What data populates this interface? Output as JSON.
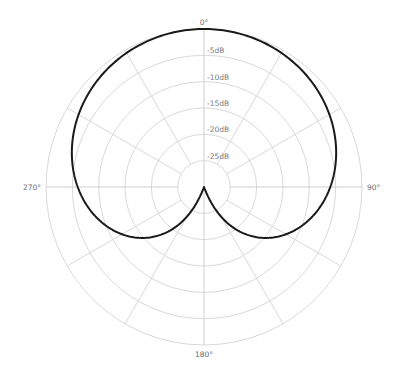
{
  "chart_data": {
    "type": "polar-line",
    "title": "",
    "pattern": "cardioid",
    "center": [
      204,
      187
    ],
    "outer_radius": 158,
    "db_range": [
      -30,
      0
    ],
    "rings_db": [
      0,
      -5,
      -10,
      -15,
      -20,
      -25
    ],
    "ring_labels": [
      "-5dB",
      "-10dB",
      "-15dB",
      "-20dB",
      "-25dB"
    ],
    "spoke_step_deg": 30,
    "angle_labels": [
      {
        "angle": 0,
        "text": "0°"
      },
      {
        "angle": 90,
        "text": "90°"
      },
      {
        "angle": 180,
        "text": "180°"
      },
      {
        "angle": 270,
        "text": "270°"
      }
    ],
    "series": [
      {
        "name": "Cardioid response",
        "formula": "gain = 0.5*(1+cos(theta)), level_dB = 20*log10(gain)",
        "angles_deg": [
          0,
          30,
          60,
          90,
          120,
          150,
          180,
          210,
          240,
          270,
          300,
          330
        ],
        "values_db": [
          0,
          -0.6,
          -2.5,
          -6.0,
          -12.0,
          -23.4,
          -30,
          -23.4,
          -12.0,
          -6.0,
          -2.5,
          -0.6
        ]
      }
    ],
    "colors": {
      "curve": "#1a1a1a",
      "grid": "#d9d9d9",
      "labels": "#7a7a7a"
    }
  }
}
